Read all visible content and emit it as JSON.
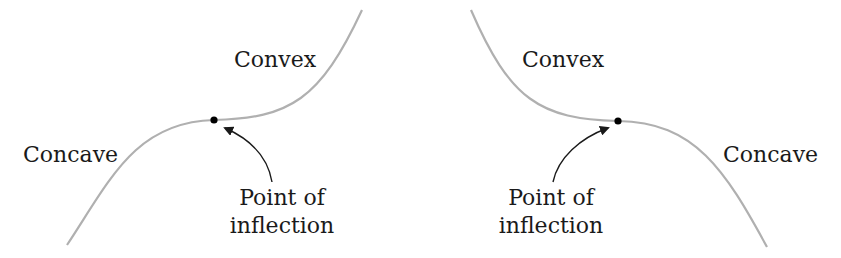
{
  "diagram": {
    "left_panel": {
      "upper_label": "Convex",
      "lower_label": "Concave",
      "point_label_line1": "Point of",
      "point_label_line2": "inflection"
    },
    "right_panel": {
      "upper_label": "Convex",
      "lower_label": "Concave",
      "point_label_line1": "Point of",
      "point_label_line2": "inflection"
    },
    "colors": {
      "curve": "#b0b0b0",
      "point": "#000000",
      "arrow": "#1a1a1a",
      "text": "#1a1a1a"
    }
  }
}
